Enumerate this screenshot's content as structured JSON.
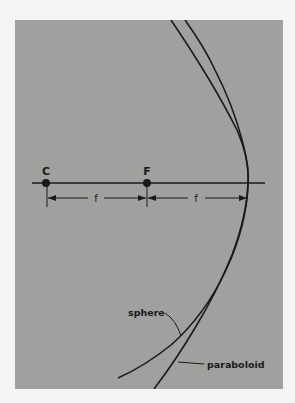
{
  "figure": {
    "points": {
      "center_label": "C",
      "focus_label": "F"
    },
    "dimensions": {
      "left_label": "f",
      "right_label": "f"
    },
    "curves": {
      "sphere_label": "sphere",
      "paraboloid_label": "paraboloid"
    },
    "colors": {
      "panel": "#a0a09e",
      "ink": "#1a1a1a",
      "page": "#f4f4f2"
    }
  }
}
